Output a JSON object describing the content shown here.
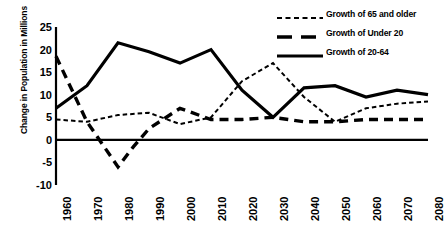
{
  "chart_data": {
    "type": "line",
    "title": "",
    "xlabel": "",
    "ylabel": "Change in Population in Millions",
    "categories": [
      1960,
      1970,
      1980,
      1990,
      2000,
      2010,
      2020,
      2030,
      2040,
      2050,
      2060,
      2070,
      2080
    ],
    "x_tick_labels": [
      "1960",
      "1970",
      "1980",
      "1990",
      "2000",
      "2010",
      "2020",
      "2030",
      "2040",
      "2050",
      "2060",
      "2070",
      "2080"
    ],
    "y_tick_labels": [
      "25",
      "20",
      "15",
      "10",
      "5",
      "0",
      "-5",
      "-10"
    ],
    "y_ticks": [
      25,
      20,
      15,
      10,
      5,
      0,
      -5,
      -10
    ],
    "ylim": [
      -10,
      25
    ],
    "xlim": [
      1960,
      2080
    ],
    "grid": false,
    "legend_position": "top-right",
    "zero_line": true,
    "series": [
      {
        "name": "Growth of 65 and older",
        "style": "fine-dashed",
        "color": "#000000",
        "values": [
          4.5,
          4.0,
          5.5,
          6.0,
          3.5,
          5.0,
          13.0,
          17.0,
          9.5,
          4.0,
          7.0,
          8.0,
          8.5
        ]
      },
      {
        "name": "Growth of Under 20",
        "style": "long-dashed",
        "color": "#000000",
        "values": [
          18.5,
          4.0,
          -6.0,
          2.5,
          7.0,
          4.5,
          4.5,
          5.0,
          4.0,
          4.0,
          4.5,
          4.5,
          4.5
        ]
      },
      {
        "name": "Growth of 20-64",
        "style": "solid",
        "color": "#000000",
        "values": [
          7.0,
          12.0,
          21.5,
          19.5,
          17.0,
          20.0,
          11.0,
          5.0,
          11.5,
          12.0,
          9.5,
          11.0,
          10.0
        ]
      }
    ],
    "extra_vertices": {
      "note": "Under 20 has an intermediate inflection between 1980 and 1990",
      "under_20_mid": {
        "x": 1985,
        "y": -1.5
      }
    }
  },
  "legend": {
    "items": [
      {
        "label": "Growth of 65 and older",
        "style": "fine-dashed"
      },
      {
        "label": "Growth of Under 20",
        "style": "long-dashed"
      },
      {
        "label": "Growth of 20-64",
        "style": "solid"
      }
    ]
  },
  "axes": {
    "y_title": "Change in Population in Millions"
  }
}
